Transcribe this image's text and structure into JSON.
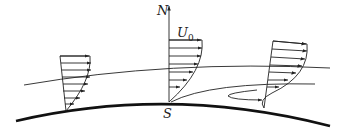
{
  "diagram": {
    "labels": {
      "normal_axis": "N",
      "free_stream": "U",
      "free_stream_sub": "0",
      "separation_point": "S"
    },
    "profiles": [
      {
        "name": "upstream-profile",
        "description": "attached boundary layer velocity profile"
      },
      {
        "name": "separation-profile",
        "description": "profile at separation point with zero wall shear"
      },
      {
        "name": "downstream-profile",
        "description": "separated profile with reverse flow near wall"
      }
    ],
    "colors": {
      "stroke": "#222222",
      "background": "#ffffff"
    }
  }
}
